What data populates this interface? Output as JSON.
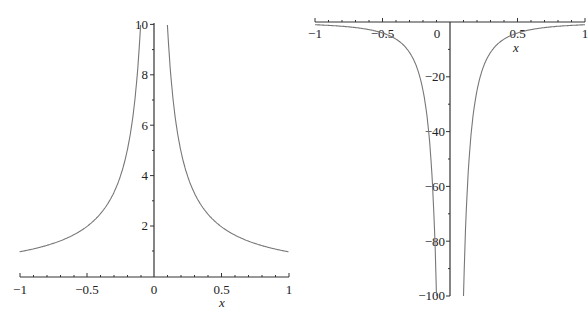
{
  "chart_data": [
    {
      "type": "line",
      "title": "",
      "function": "1/|x|",
      "xlabel": "x",
      "ylabel": "",
      "xlim": [
        -1,
        1
      ],
      "ylim": [
        0,
        10
      ],
      "x_ticks": [
        "-1",
        "-0.5",
        "0",
        "0.5",
        "1"
      ],
      "y_ticks": [
        "2",
        "4",
        "6",
        "8",
        "10"
      ],
      "grid": false,
      "series": [
        {
          "name": "y = 1/|x|",
          "x": [
            -1,
            -0.75,
            -0.5,
            -0.4,
            -0.3,
            -0.25,
            -0.2,
            -0.15,
            -0.1,
            0.1,
            0.15,
            0.2,
            0.25,
            0.3,
            0.4,
            0.5,
            0.75,
            1
          ],
          "y": [
            1,
            1.33,
            2,
            2.5,
            3.33,
            4,
            5,
            6.67,
            10,
            10,
            6.67,
            5,
            4,
            3.33,
            2.5,
            2,
            1.33,
            1
          ]
        }
      ]
    },
    {
      "type": "line",
      "title": "",
      "function": "-1/x^2",
      "xlabel": "x",
      "ylabel": "",
      "xlim": [
        -1,
        1
      ],
      "ylim": [
        -100,
        0
      ],
      "x_ticks": [
        "-1",
        "-0.5",
        "0",
        "0.5",
        "1"
      ],
      "y_ticks": [
        "-20",
        "-40",
        "-60",
        "-80",
        "-100"
      ],
      "grid": false,
      "series": [
        {
          "name": "y = -1/x^2",
          "x": [
            -1,
            -0.75,
            -0.5,
            -0.4,
            -0.3,
            -0.25,
            -0.2,
            -0.15,
            -0.12,
            -0.1,
            0.1,
            0.12,
            0.15,
            0.2,
            0.25,
            0.3,
            0.4,
            0.5,
            0.75,
            1
          ],
          "y": [
            -1,
            -1.78,
            -4,
            -6.25,
            -11.1,
            -16,
            -25,
            -44.4,
            -69.4,
            -100,
            -100,
            -69.4,
            -44.4,
            -25,
            -16,
            -11.1,
            -6.25,
            -4,
            -1.78,
            -1
          ]
        }
      ]
    }
  ],
  "left_chart": {
    "x_ticks": [
      "-1",
      "-0.5",
      "0",
      "0.5",
      "1"
    ],
    "y_ticks": [
      "2",
      "4",
      "6",
      "8",
      "10"
    ],
    "xlabel": "x"
  },
  "right_chart": {
    "x_ticks": [
      "-1",
      "-0.5",
      "0",
      "0.5",
      "1"
    ],
    "y_ticks": [
      "-20",
      "-40",
      "-60",
      "-80",
      "-100"
    ],
    "xlabel": "x"
  },
  "colors": {
    "axis": "#333333",
    "curve": "#777777",
    "background": "#ffffff"
  }
}
